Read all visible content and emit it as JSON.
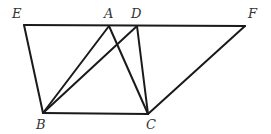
{
  "diagram": {
    "type": "geometry",
    "stroke_color": "#1a1a1a",
    "label_color": "#333333",
    "points": {
      "E": {
        "x": 24,
        "y": 25,
        "label": "E",
        "lx": 12,
        "ly": 18
      },
      "A": {
        "x": 109,
        "y": 26,
        "label": "A",
        "lx": 104,
        "ly": 18
      },
      "D": {
        "x": 137,
        "y": 26,
        "label": "D",
        "lx": 131,
        "ly": 18
      },
      "F": {
        "x": 245,
        "y": 26,
        "label": "F",
        "lx": 248,
        "ly": 18
      },
      "B": {
        "x": 43,
        "y": 113,
        "label": "B",
        "lx": 36,
        "ly": 129
      },
      "C": {
        "x": 148,
        "y": 114,
        "label": "C",
        "lx": 146,
        "ly": 129
      }
    },
    "segments": [
      [
        "E",
        "F"
      ],
      [
        "E",
        "B"
      ],
      [
        "B",
        "C"
      ],
      [
        "B",
        "A"
      ],
      [
        "B",
        "D"
      ],
      [
        "A",
        "C"
      ],
      [
        "D",
        "C"
      ],
      [
        "C",
        "F"
      ]
    ]
  }
}
